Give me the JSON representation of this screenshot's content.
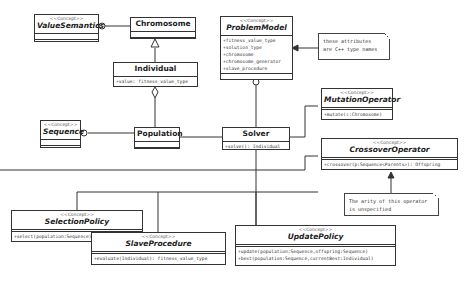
{
  "diagram": {
    "type": "UML class diagram",
    "classes": {
      "value_semantics": {
        "stereotype": "<<Concept>>",
        "name": "ValueSemantics",
        "attributes": [],
        "operations": []
      },
      "chromosome": {
        "name": "Chromosome",
        "attributes": [],
        "operations": []
      },
      "individual": {
        "name": "Individual",
        "attributes": [
          "+value: fitness_value_type"
        ],
        "operations": []
      },
      "sequence": {
        "stereotype": "<<Concept>>",
        "name": "Sequence",
        "attributes": [],
        "operations": []
      },
      "population": {
        "name": "Population",
        "attributes": [],
        "operations": []
      },
      "problem_model": {
        "stereotype": "<<Concept>>",
        "name": "ProblemModel",
        "attributes": [
          "+fitness_value_type",
          "+solution_type",
          "+chromosome",
          "+chromosome_generator",
          "+slave_procedure"
        ],
        "operations": []
      },
      "solver": {
        "name": "Solver",
        "attributes": [],
        "operations": [
          "+solve(): Individual"
        ]
      },
      "mutation_operator": {
        "stereotype": "<<Concept>>",
        "name": "MutationOperator",
        "operations": [
          "+mutate(c:Chromosome)"
        ]
      },
      "crossover_operator": {
        "stereotype": "<<Concept>>",
        "name": "CrossoverOperator",
        "operations": [
          "+crossover(p:Sequence<Parents>): Offspring"
        ]
      },
      "selection_policy": {
        "stereotype": "<<Concept>>",
        "name": "SelectionPolicy",
        "operations": [
          "+select(population:Sequence): Individual"
        ]
      },
      "slave_procedure": {
        "stereotype": "<<Concept>>",
        "name": "SlaveProcedure",
        "operations": [
          "+evaluate(Individual): fitness_value_type"
        ]
      },
      "update_policy": {
        "stereotype": "<<Concept>>",
        "name": "UpdatePolicy",
        "operations": [
          "+update(population:Sequence,offspring:Sequence)",
          "+best(population:Sequence,currentBest:Individual)"
        ]
      }
    },
    "notes": {
      "type_names": [
        "these attributes",
        "are C++ type names"
      ],
      "arity": [
        "The arity of this operator",
        "is unspecified"
      ]
    },
    "relationships": [
      {
        "from": "Chromosome",
        "to": "ValueSemantics",
        "kind": "realization-lollipop"
      },
      {
        "from": "Individual",
        "to": "Chromosome",
        "kind": "generalization"
      },
      {
        "from": "Population",
        "to": "Individual",
        "kind": "aggregation"
      },
      {
        "from": "Population",
        "to": "Sequence",
        "kind": "realization-lollipop"
      },
      {
        "from": "Solver",
        "to": "ProblemModel",
        "kind": "realization-lollipop"
      },
      {
        "from": "Solver",
        "to": "Population",
        "kind": "association"
      },
      {
        "from": "Solver",
        "to": "MutationOperator",
        "kind": "association"
      },
      {
        "from": "Solver",
        "to": "CrossoverOperator",
        "kind": "association"
      },
      {
        "from": "Solver",
        "to": "SelectionPolicy",
        "kind": "association"
      },
      {
        "from": "Solver",
        "to": "SlaveProcedure",
        "kind": "association"
      },
      {
        "from": "Solver",
        "to": "UpdatePolicy",
        "kind": "association"
      },
      {
        "from": "note.type_names",
        "to": "ProblemModel",
        "kind": "note-anchor"
      },
      {
        "from": "note.arity",
        "to": "CrossoverOperator",
        "kind": "note-anchor"
      }
    ]
  }
}
